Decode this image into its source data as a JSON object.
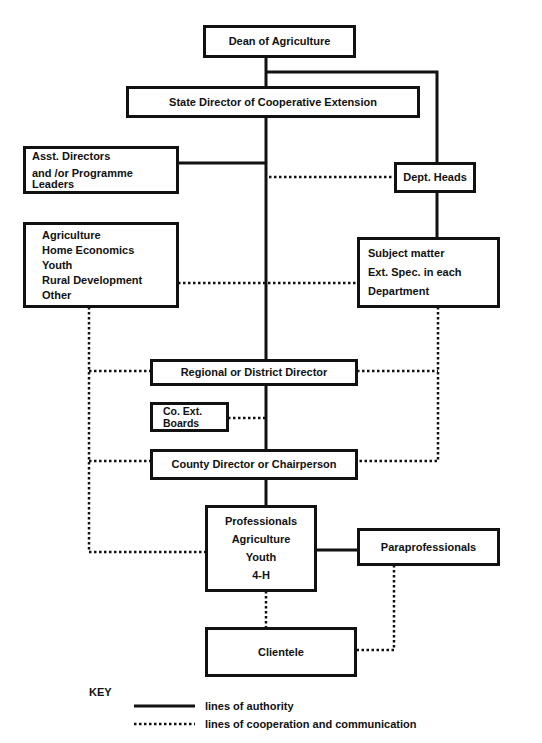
{
  "diagram": {
    "type": "organizational-chart",
    "nodes": {
      "dean": {
        "label": "Dean of Agriculture"
      },
      "state_director": {
        "label": "State Director of Cooperative Extension"
      },
      "asst_directors": {
        "lines": [
          "Asst. Directors",
          "and /or Programme Leaders"
        ]
      },
      "dept_heads": {
        "label": "Dept. Heads"
      },
      "program_areas": {
        "lines": [
          "Agriculture",
          "Home Economics",
          "Youth",
          "Rural Development",
          "Other"
        ]
      },
      "subject_matter": {
        "lines": [
          "Subject matter",
          "Ext. Spec. in each",
          "Department"
        ]
      },
      "regional_director": {
        "label": "Regional or District Director"
      },
      "co_ext_boards": {
        "lines": [
          "Co. Ext.",
          "Boards"
        ]
      },
      "county_director": {
        "label": "County Director or Chairperson"
      },
      "professionals": {
        "lines": [
          "Professionals",
          "Agriculture",
          "Youth",
          "4-H"
        ]
      },
      "paraprofessionals": {
        "label": "Paraprofessionals"
      },
      "clientele": {
        "label": "Clientele"
      }
    },
    "edges": [
      {
        "from": "dean",
        "to": "state_director",
        "style": "solid"
      },
      {
        "from": "dean",
        "to": "dept_heads",
        "style": "solid"
      },
      {
        "from": "state_director",
        "to": "asst_directors",
        "style": "solid"
      },
      {
        "from": "state_director",
        "to": "dept_heads",
        "style": "dotted"
      },
      {
        "from": "dept_heads",
        "to": "subject_matter",
        "style": "solid"
      },
      {
        "from": "program_areas",
        "to": "subject_matter",
        "style": "dotted"
      },
      {
        "from": "state_director",
        "to": "regional_director",
        "style": "solid"
      },
      {
        "from": "program_areas",
        "to": "regional_director",
        "style": "dotted"
      },
      {
        "from": "subject_matter",
        "to": "regional_director",
        "style": "dotted"
      },
      {
        "from": "co_ext_boards",
        "to": "county_director",
        "style": "dotted"
      },
      {
        "from": "regional_director",
        "to": "county_director",
        "style": "solid"
      },
      {
        "from": "program_areas",
        "to": "county_director",
        "style": "dotted"
      },
      {
        "from": "subject_matter",
        "to": "county_director",
        "style": "dotted"
      },
      {
        "from": "county_director",
        "to": "professionals",
        "style": "solid"
      },
      {
        "from": "program_areas",
        "to": "professionals",
        "style": "dotted"
      },
      {
        "from": "professionals",
        "to": "paraprofessionals",
        "style": "solid"
      },
      {
        "from": "professionals",
        "to": "clientele",
        "style": "dotted"
      },
      {
        "from": "paraprofessionals",
        "to": "clientele",
        "style": "dotted"
      }
    ]
  },
  "key": {
    "title": "KEY",
    "items": [
      {
        "style": "solid",
        "label": "lines of authority"
      },
      {
        "style": "dotted",
        "label": "lines of cooperation and communication"
      }
    ]
  },
  "colors": {
    "line": "#111111",
    "background": "#ffffff"
  }
}
